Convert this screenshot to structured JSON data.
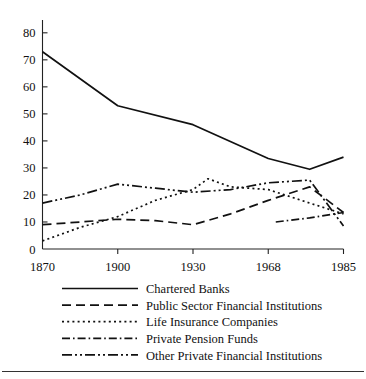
{
  "chart_data": {
    "type": "line",
    "title": "",
    "subtitle": "",
    "xlabel": "",
    "ylabel": "",
    "categories": [
      "1870",
      "1900",
      "1930",
      "1968",
      "1985"
    ],
    "x_tick_labels": [
      "1870",
      "1900",
      "1930",
      "1968",
      "1985"
    ],
    "y_tick_labels": [
      "0",
      "10",
      "20",
      "30",
      "40",
      "50",
      "60",
      "70",
      "80"
    ],
    "y_ticks": [
      0,
      10,
      20,
      30,
      40,
      50,
      60,
      70,
      80
    ],
    "ylim": [
      0,
      84
    ],
    "xlim": [
      0,
      4
    ],
    "grid": false,
    "legend_position": "below",
    "series": [
      {
        "name": "Chartered Banks",
        "style": "solid",
        "dash": "none",
        "color": "#111111",
        "x": [
          0,
          1,
          2,
          3,
          3.55,
          4
        ],
        "values": [
          73,
          53,
          46,
          33.5,
          29.5,
          34
        ]
      },
      {
        "name": "Public Sector Financial Institutions",
        "style": "dashed",
        "dash": "9,5",
        "color": "#111111",
        "x": [
          0,
          0.5,
          1,
          1.5,
          2,
          2.5,
          3,
          3.55,
          4
        ],
        "values": [
          9,
          10,
          11,
          10.5,
          9,
          13,
          18,
          23,
          13.5
        ]
      },
      {
        "name": "Life Insurance Companies",
        "style": "dotted",
        "dash": "2,3.2",
        "color": "#111111",
        "x": [
          0,
          0.5,
          1,
          1.5,
          2,
          2.2,
          2.5,
          3,
          3.55,
          4
        ],
        "values": [
          3,
          8,
          12,
          18,
          22,
          26,
          23,
          22,
          17,
          13
        ]
      },
      {
        "name": "Private Pension Funds",
        "style": "dash-dot",
        "dash": "8,3,1.6,3",
        "color": "#111111",
        "x": [
          3.1,
          3.55,
          4
        ],
        "values": [
          10,
          11.5,
          13.5
        ]
      },
      {
        "name": "Other Private Financial Institutions",
        "style": "dash-dot-dot",
        "dash": "10,3,2,3,2,3",
        "color": "#111111",
        "x": [
          0,
          0.5,
          1,
          1.5,
          2,
          2.5,
          3,
          3.55,
          4
        ],
        "values": [
          17,
          20,
          24,
          22.5,
          21,
          22,
          24.5,
          25.5,
          8.5
        ]
      }
    ]
  },
  "legend": {
    "items": [
      {
        "label": "Chartered Banks"
      },
      {
        "label": "Public Sector Financial Institutions"
      },
      {
        "label": "Life Insurance Companies"
      },
      {
        "label": "Private Pension Funds"
      },
      {
        "label": "Other Private Financial Institutions"
      }
    ]
  }
}
